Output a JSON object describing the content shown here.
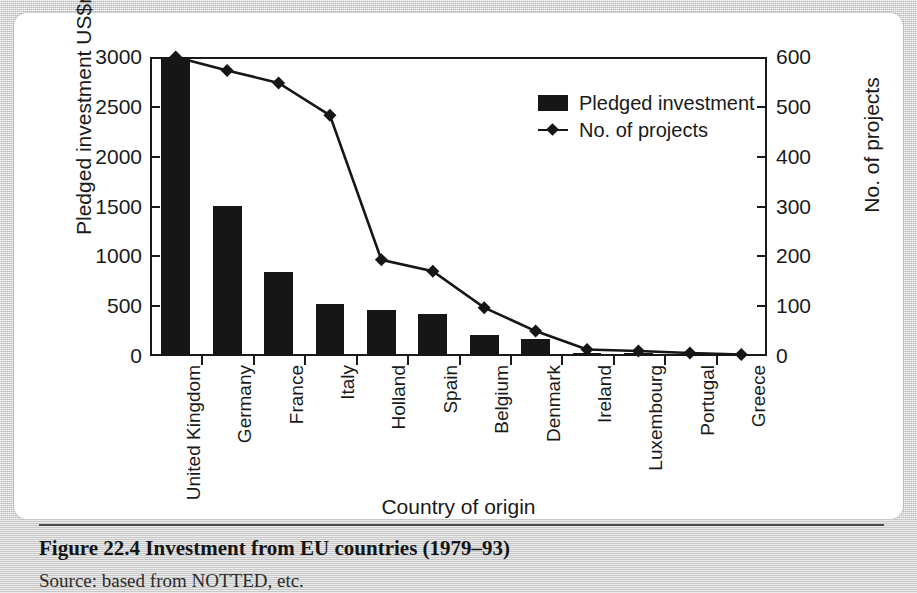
{
  "figure": {
    "caption_title": "Figure 22.4   Investment from EU countries (1979–93)",
    "caption_source": "Source: based from NOTTED, etc."
  },
  "chart_data": {
    "type": "bar",
    "title": "",
    "xlabel": "Country of origin",
    "ylabel": "Pledged investment US$m",
    "y2label": "No. of projects",
    "grid": false,
    "legend_position": "top-right",
    "categories": [
      "United Kingdom",
      "Germany",
      "France",
      "Italy",
      "Holland",
      "Spain",
      "Belgium",
      "Denmark",
      "Ireland",
      "Luxembourg",
      "Portugal",
      "Greece"
    ],
    "ylim": [
      0,
      3000
    ],
    "yticks": [
      0,
      500,
      1000,
      1500,
      2000,
      2500,
      3000
    ],
    "y2lim": [
      0,
      600
    ],
    "y2ticks": [
      0,
      100,
      200,
      300,
      400,
      500,
      600
    ],
    "series": [
      {
        "name": "Pledged investment",
        "axis": "left",
        "units": "US$m",
        "type": "bar",
        "values": [
          3000,
          1510,
          845,
          520,
          460,
          425,
          210,
          175,
          35,
          30,
          20,
          10
        ]
      },
      {
        "name": "No. of projects",
        "axis": "right",
        "units": "projects",
        "type": "line",
        "values": [
          600,
          573,
          548,
          483,
          193,
          170,
          97,
          50,
          13,
          10,
          6,
          3
        ]
      }
    ]
  }
}
